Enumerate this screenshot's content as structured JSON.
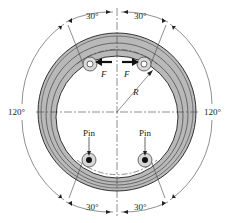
{
  "diagram": {
    "type": "brake drum with pivoted shoes / pins",
    "labels": {
      "angle_top_left": "30°",
      "angle_top_right": "30°",
      "angle_bottom_left": "30°",
      "angle_bottom_right": "30°",
      "angle_left": "120°",
      "angle_right": "120°",
      "force_left": "F",
      "force_right": "F",
      "radius": "R",
      "pin_left": "Pin",
      "pin_right": "Pin"
    },
    "colors": {
      "ring_fill": "#b8b8b8",
      "line": "#222222",
      "background": "#ffffff"
    }
  }
}
